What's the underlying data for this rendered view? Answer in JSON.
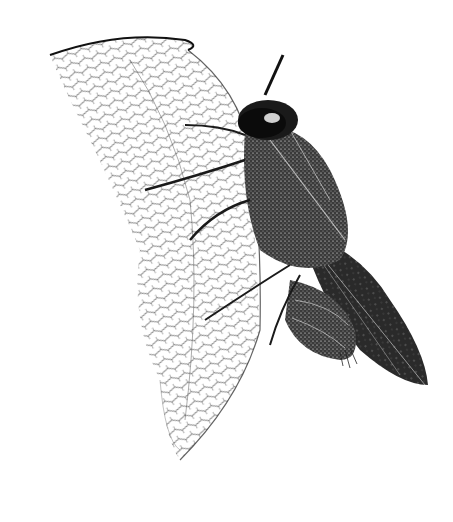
{
  "image": {
    "subject": "fly illustration",
    "style": "stipple pen-and-ink",
    "background_color": "#ffffff",
    "ink_color": "#111111"
  }
}
